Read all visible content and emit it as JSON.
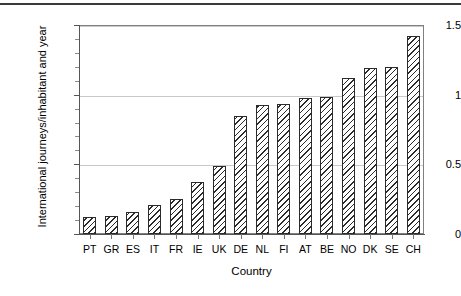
{
  "chart_data": {
    "type": "bar",
    "title": "",
    "xlabel": "Country",
    "ylabel": "International journeys/inhabitant and year",
    "categories": [
      "PT",
      "GR",
      "ES",
      "IT",
      "FR",
      "IE",
      "UK",
      "DE",
      "NL",
      "FI",
      "AT",
      "BE",
      "NO",
      "DK",
      "SE",
      "CH"
    ],
    "values": [
      0.12,
      0.13,
      0.155,
      0.21,
      0.25,
      0.37,
      0.49,
      0.845,
      0.925,
      0.93,
      0.975,
      0.985,
      1.12,
      1.19,
      1.2,
      1.42
    ],
    "ylim": [
      0,
      1.5
    ],
    "ytick_labels": [
      "0",
      "0.5",
      "1",
      "1.5"
    ],
    "ytick_values": [
      0,
      0.5,
      1,
      1.5
    ],
    "yminor_values": [
      0.1,
      0.2,
      0.3,
      0.4,
      0.6,
      0.7,
      0.8,
      0.9,
      1.1,
      1.2,
      1.3,
      1.4
    ],
    "grid": "horizontal",
    "legend": "none",
    "bar_fill": "diagonal-hatch",
    "bar_edge_color": "#2b2b2b",
    "background": "#ffffff"
  },
  "figure": {
    "top_rule": true
  }
}
